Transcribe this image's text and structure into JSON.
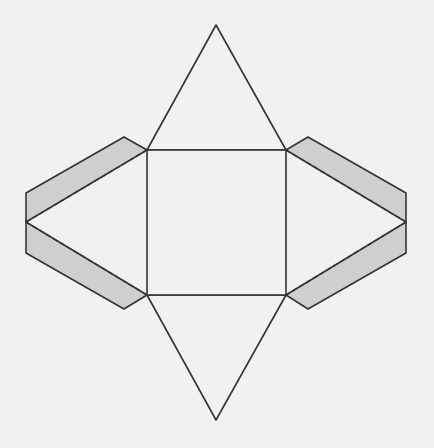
{
  "diagram": {
    "colors": {
      "background": "#f1f1ef",
      "stroke": "#333333",
      "tab_fill": "#cfcfcf",
      "face_fill": "#f1f1ef"
    },
    "square": {
      "x1": 147,
      "y1": 150,
      "x2": 286,
      "y2": 295
    },
    "triangles": {
      "top": [
        [
          147,
          150
        ],
        [
          216,
          25
        ],
        [
          286,
          150
        ]
      ],
      "bottom": [
        [
          147,
          295
        ],
        [
          216,
          420
        ],
        [
          286,
          295
        ]
      ]
    },
    "tabs": {
      "left_upper": [
        [
          147,
          150
        ],
        [
          124,
          137
        ],
        [
          26,
          193
        ],
        [
          26,
          222
        ]
      ],
      "left_lower": [
        [
          26,
          222
        ],
        [
          26,
          253
        ],
        [
          124,
          309
        ],
        [
          147,
          295
        ]
      ],
      "right_upper": [
        [
          286,
          150
        ],
        [
          308,
          137
        ],
        [
          406,
          193
        ],
        [
          406,
          222
        ]
      ],
      "right_lower": [
        [
          406,
          222
        ],
        [
          406,
          253
        ],
        [
          308,
          309
        ],
        [
          286,
          295
        ]
      ]
    },
    "fold_lines": [
      [
        [
          147,
          150
        ],
        [
          26,
          222
        ]
      ],
      [
        [
          26,
          222
        ],
        [
          147,
          295
        ]
      ],
      [
        [
          286,
          150
        ],
        [
          406,
          222
        ]
      ],
      [
        [
          406,
          222
        ],
        [
          286,
          295
        ]
      ]
    ]
  }
}
